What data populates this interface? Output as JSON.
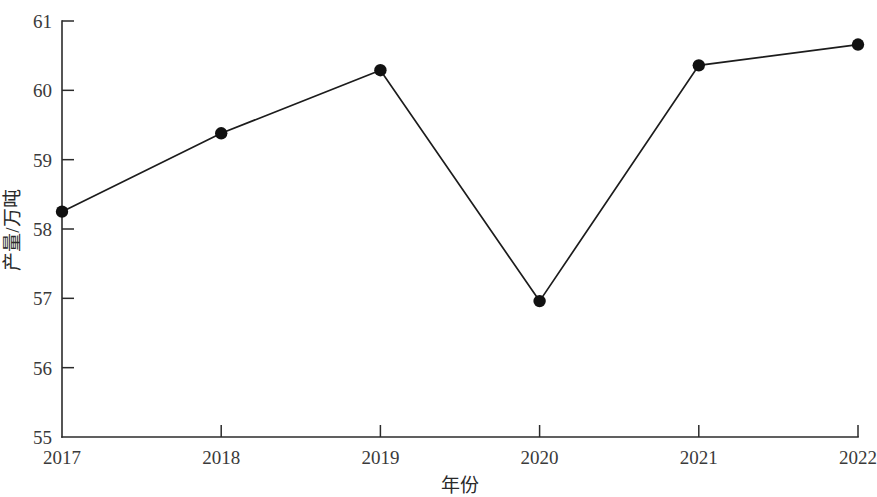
{
  "chart_data": {
    "type": "line",
    "title": "",
    "subtitle": "",
    "xlabel": "年份",
    "ylabel": "产量/万吨",
    "categories": [
      "2017",
      "2018",
      "2019",
      "2020",
      "2021",
      "2022"
    ],
    "x": [
      2017,
      2018,
      2019,
      2020,
      2021,
      2022
    ],
    "values": [
      58.25,
      59.38,
      60.29,
      56.96,
      60.36,
      60.66
    ],
    "series": [
      {
        "name": "产量",
        "values": [
          58.25,
          59.38,
          60.29,
          56.96,
          60.36,
          60.66
        ]
      }
    ],
    "xlim": [
      2017,
      2022
    ],
    "ylim": [
      55,
      61
    ],
    "ytick_labels": [
      "55",
      "56",
      "57",
      "58",
      "59",
      "60",
      "61"
    ],
    "ytick_values": [
      55,
      56,
      57,
      58,
      59,
      60,
      61
    ],
    "xtick_labels": [
      "2017",
      "2018",
      "2019",
      "2020",
      "2021",
      "2022"
    ],
    "grid": false,
    "legend": "none",
    "marker": "filled-circle",
    "line_color": "#1c1c1c",
    "marker_color": "#111111",
    "axis_color": "#2b2b2b",
    "background_color": "#ffffff"
  },
  "axis": {
    "y_title": "产量/万吨",
    "x_title": "年份",
    "y_ticks": [
      {
        "label": "61",
        "value": 61
      },
      {
        "label": "60",
        "value": 60
      },
      {
        "label": "59",
        "value": 59
      },
      {
        "label": "58",
        "value": 58
      },
      {
        "label": "57",
        "value": 57
      },
      {
        "label": "56",
        "value": 56
      },
      {
        "label": "55",
        "value": 55
      }
    ],
    "x_ticks": [
      {
        "label": "2017",
        "value": 2017
      },
      {
        "label": "2018",
        "value": 2018
      },
      {
        "label": "2019",
        "value": 2019
      },
      {
        "label": "2020",
        "value": 2020
      },
      {
        "label": "2021",
        "value": 2021
      },
      {
        "label": "2022",
        "value": 2022
      }
    ]
  },
  "points": [
    {
      "year": "2017",
      "value": "58.25"
    },
    {
      "year": "2018",
      "value": "59.38"
    },
    {
      "year": "2019",
      "value": "60.29"
    },
    {
      "year": "2020",
      "value": "56.96"
    },
    {
      "year": "2021",
      "value": "60.36"
    },
    {
      "year": "2022",
      "value": "60.66"
    }
  ]
}
